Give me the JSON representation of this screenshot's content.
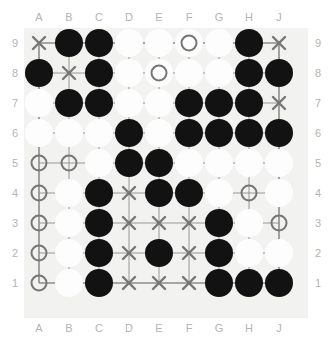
{
  "board": {
    "name": "go-board",
    "size": 9,
    "col_labels": [
      "A",
      "B",
      "C",
      "D",
      "E",
      "F",
      "G",
      "H",
      "J"
    ],
    "row_labels": [
      "9",
      "8",
      "7",
      "6",
      "5",
      "4",
      "3",
      "2",
      "1"
    ],
    "colors": {
      "board_background": "#f2f2f0",
      "grid_line": "#8c8c8c",
      "black_stone": "#121212",
      "white_stone": "#fdfdfd",
      "marker": "#767676",
      "label_text": "#b4b4b4",
      "page_background": "#ffffff"
    },
    "legend": {
      "empty": ".",
      "black_stone": "B",
      "white_stone": "W",
      "cross_mark": "X",
      "circle_mark": "O",
      "white_stone_with_circle": "WO"
    },
    "rows": [
      {
        "label": "9",
        "cells": [
          "X",
          "B",
          "B",
          "W",
          "W",
          "WO",
          "W",
          "B",
          "X"
        ]
      },
      {
        "label": "8",
        "cells": [
          "B",
          "X",
          "B",
          "W",
          "WO",
          "W",
          "W",
          "B",
          "B"
        ]
      },
      {
        "label": "7",
        "cells": [
          "W",
          "B",
          "B",
          "W",
          "W",
          "B",
          "B",
          "B",
          "X"
        ]
      },
      {
        "label": "6",
        "cells": [
          "W",
          "W",
          "W",
          "B",
          "W",
          "B",
          "B",
          "B",
          "B"
        ]
      },
      {
        "label": "5",
        "cells": [
          "O",
          "O",
          "W",
          "B",
          "B",
          "W",
          "W",
          "W",
          "W"
        ]
      },
      {
        "label": "4",
        "cells": [
          "O",
          "W",
          "B",
          "X",
          "B",
          "B",
          "W",
          "O",
          "W"
        ]
      },
      {
        "label": "3",
        "cells": [
          "O",
          "W",
          "B",
          "X",
          "X",
          "X",
          "B",
          "W",
          "O"
        ]
      },
      {
        "label": "2",
        "cells": [
          "O",
          "W",
          "B",
          "X",
          "B",
          "X",
          "B",
          "W",
          "W"
        ]
      },
      {
        "label": "1",
        "cells": [
          "O",
          "W",
          "B",
          "X",
          "X",
          "X",
          "B",
          "B",
          "B"
        ]
      }
    ],
    "counts": {
      "black_stones": "33",
      "white_stones": "31",
      "cross_marks": "12",
      "circle_marks": "9"
    }
  }
}
